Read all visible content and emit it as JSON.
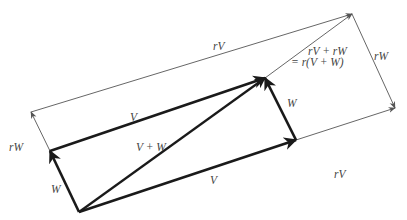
{
  "diagram": {
    "colors": {
      "thick": "#1a1a1a",
      "thin": "#555555",
      "label": "#444444"
    },
    "points": {
      "origin": [
        79,
        212
      ],
      "W": [
        50,
        151
      ],
      "V": [
        296,
        140
      ],
      "V_plus_W": [
        265,
        78
      ],
      "rW": [
        31,
        112
      ],
      "rV": [
        395,
        108
      ],
      "r_V_plus_W": [
        352,
        14
      ]
    },
    "labels": {
      "V_top": "V",
      "V_bottom": "V",
      "W_left": "W",
      "W_right": "W",
      "V_plus_W": "V + W",
      "rV_top": "rV",
      "rV_bottom": "rV",
      "rW_left": "rW",
      "rW_right": "rW",
      "sum_line1": "rV + rW",
      "sum_line2": "= r(V + W)"
    }
  }
}
